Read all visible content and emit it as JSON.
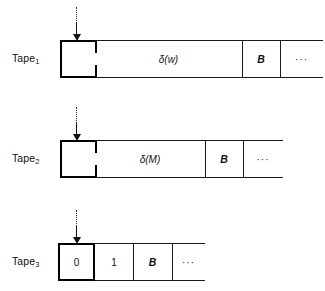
{
  "figure": {
    "ink_color": "#111111",
    "background": "#ffffff"
  },
  "tapes": [
    {
      "id": "tape-1",
      "label": "Tape",
      "subscript": "1",
      "head_position": 0,
      "head_marker": "downward-arrow-icon",
      "cells": [
        {
          "name": "head-cell",
          "value": "",
          "style": "head"
        },
        {
          "name": "content-cell",
          "value": "δ(w)",
          "style": "italic"
        },
        {
          "name": "blank-cell",
          "value": "B",
          "style": "bold-italic"
        },
        {
          "name": "ellipsis-cell",
          "value": "···",
          "style": "dots"
        }
      ]
    },
    {
      "id": "tape-2",
      "label": "Tape",
      "subscript": "2",
      "head_position": 0,
      "head_marker": "downward-arrow-icon",
      "cells": [
        {
          "name": "head-cell",
          "value": "",
          "style": "head"
        },
        {
          "name": "content-cell",
          "value": "δ(M)",
          "style": "italic"
        },
        {
          "name": "blank-cell",
          "value": "B",
          "style": "bold-italic"
        },
        {
          "name": "ellipsis-cell",
          "value": "···",
          "style": "dots"
        }
      ]
    },
    {
      "id": "tape-3",
      "label": "Tape",
      "subscript": "3",
      "head_position": 0,
      "head_marker": "downward-arrow-icon",
      "cells": [
        {
          "name": "head-cell",
          "value": "0",
          "style": "head"
        },
        {
          "name": "content-cell",
          "value": "1",
          "style": "plain"
        },
        {
          "name": "blank-cell",
          "value": "B",
          "style": "bold-italic"
        },
        {
          "name": "ellipsis-cell",
          "value": "···",
          "style": "dots"
        }
      ]
    }
  ]
}
